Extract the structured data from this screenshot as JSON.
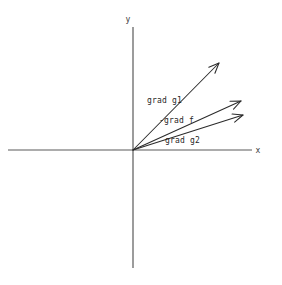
{
  "figure": {
    "title": "",
    "background_color": "#ffffff",
    "width": 282,
    "height": 285
  },
  "axes": {
    "origin": {
      "x": 133,
      "y": 150
    },
    "x_axis": {
      "label": "x",
      "label_pos": {
        "x": 258,
        "y": 153
      },
      "from": {
        "x": 8,
        "y": 150
      },
      "to": {
        "x": 252,
        "y": 150
      },
      "color": "#5a5a5a"
    },
    "y_axis": {
      "label": "y",
      "label_pos": {
        "x": 128,
        "y": 22
      },
      "from": {
        "x": 133,
        "y": 27
      },
      "to": {
        "x": 133,
        "y": 268
      },
      "color": "#5a5a5a"
    }
  },
  "chart_data": {
    "type": "scatter",
    "title": "",
    "xlabel": "x",
    "ylabel": "y",
    "grid": false,
    "legend": "none",
    "origin_px": {
      "x": 133,
      "y": 150
    },
    "xlim": [
      8,
      252
    ],
    "ylim": [
      27,
      268
    ],
    "annotations": [
      "grad g1",
      "-grad f",
      "grad g2"
    ],
    "vectors": [
      {
        "name": "grad g1",
        "label": "grad g1",
        "tail_px": {
          "x": 133,
          "y": 150
        },
        "tip_px": {
          "x": 219,
          "y": 63
        },
        "dx_px": 86,
        "dy_px": -87,
        "angle_deg": 45.3,
        "length_px": 122.3,
        "label_pos_px": {
          "x": 147,
          "y": 103
        },
        "color": "#2b2b2b"
      },
      {
        "name": "-grad f",
        "label": "-grad f",
        "tail_px": {
          "x": 133,
          "y": 150
        },
        "tip_px": {
          "x": 241,
          "y": 101
        },
        "dx_px": 108,
        "dy_px": -49,
        "angle_deg": 24.4,
        "length_px": 118.6,
        "label_pos_px": {
          "x": 159,
          "y": 123
        },
        "color": "#2b2b2b"
      },
      {
        "name": "grad g2",
        "label": "grad g2",
        "tail_px": {
          "x": 133,
          "y": 150
        },
        "tip_px": {
          "x": 243,
          "y": 115
        },
        "dx_px": 110,
        "dy_px": -35,
        "angle_deg": 17.6,
        "length_px": 115.4,
        "label_pos_px": {
          "x": 165,
          "y": 143
        },
        "color": "#2b2b2b"
      }
    ]
  }
}
